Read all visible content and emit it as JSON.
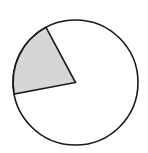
{
  "diagram": {
    "type": "fraction-circle",
    "shaded_fraction": "1/5",
    "shaded_degrees": 72,
    "colors": {
      "shaded": "#d6d6d6",
      "unshaded": "#ffffff",
      "stroke": "#1a1a1a"
    }
  }
}
